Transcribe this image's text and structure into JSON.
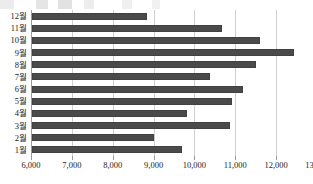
{
  "chart_data": {
    "type": "bar",
    "orientation": "horizontal",
    "title": "",
    "subtitle": "",
    "xlabel": "",
    "ylabel": "",
    "categories": [
      "1월",
      "2월",
      "3월",
      "4월",
      "5월",
      "6월",
      "7월",
      "8월",
      "9월",
      "10월",
      "11월",
      "12월"
    ],
    "values": [
      9680,
      8980,
      10840,
      9790,
      10890,
      11160,
      10350,
      11480,
      12420,
      11590,
      10650,
      8820
    ],
    "display_order": "top-to-bottom: 12월 first, 1월 last",
    "xlim": [
      6000,
      13000
    ],
    "xticks": [
      6000,
      7000,
      8000,
      9000,
      10000,
      11000,
      12000,
      13000
    ],
    "xtick_labels": [
      "6,000",
      "7,000",
      "8,000",
      "9,000",
      "10,000",
      "11,000",
      "12,000",
      "13,000"
    ],
    "grid": "vertical-only",
    "legend": "none",
    "bar_color": "#4a4a4a",
    "gridline_color": "#cfcfcf",
    "axis_color": "#9a9a9a"
  },
  "axis": {
    "x_tick_labels": [
      "6,000",
      "7,000",
      "8,000",
      "9,000",
      "10,000",
      "11,000",
      "12,000",
      "13,000"
    ],
    "y_tick_labels": [
      "12월",
      "11월",
      "10월",
      "9월",
      "8월",
      "7월",
      "6월",
      "5월",
      "4월",
      "3월",
      "2월",
      "1월"
    ]
  }
}
